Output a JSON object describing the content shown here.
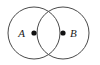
{
  "figure": {
    "type": "venn-two-circle-diagram",
    "background_color": "#ffffff",
    "stroke_color": "#4a4a4a",
    "dot_color": "#111111",
    "label_color": "#1a1a1a",
    "width": 100,
    "height": 65,
    "circles": [
      {
        "id": "circle-a",
        "cx": 34,
        "cy": 33,
        "r": 26
      },
      {
        "id": "circle-b",
        "cx": 63,
        "cy": 33,
        "r": 26
      }
    ],
    "points": [
      {
        "id": "point-a",
        "label": "A",
        "cx": 34,
        "cy": 33,
        "r": 2.6,
        "label_x": 25,
        "label_y": 37,
        "label_anchor": "end"
      },
      {
        "id": "point-b",
        "label": "B",
        "cx": 63,
        "cy": 33,
        "r": 2.6,
        "label_x": 70,
        "label_y": 37,
        "label_anchor": "start"
      }
    ]
  }
}
